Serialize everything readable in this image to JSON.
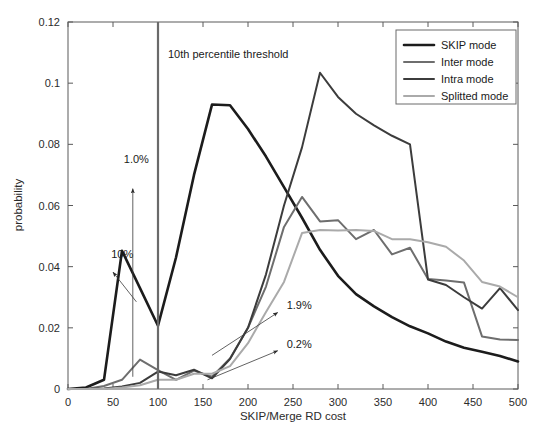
{
  "chart_data": {
    "type": "line",
    "title": "",
    "xlabel": "SKIP/Merge RD cost",
    "ylabel": "probability",
    "xlim": [
      0,
      500
    ],
    "ylim": [
      0,
      0.12
    ],
    "xticks": [
      0,
      50,
      100,
      150,
      200,
      250,
      300,
      350,
      400,
      450,
      500
    ],
    "xtick_labels": [
      "0",
      "50",
      "100",
      "150",
      "200",
      "250",
      "300",
      "350",
      "400",
      "450",
      "500"
    ],
    "yticks": [
      0,
      0.02,
      0.04,
      0.06,
      0.08,
      0.1,
      0.12
    ],
    "ytick_labels": [
      "0",
      "0.02",
      "0.04",
      "0.06",
      "0.08",
      "0.1",
      "0.12"
    ],
    "grid": false,
    "legend_position": "top-right",
    "x": [
      0,
      20,
      40,
      60,
      80,
      100,
      120,
      140,
      160,
      180,
      200,
      220,
      240,
      260,
      280,
      300,
      320,
      340,
      360,
      380,
      400,
      420,
      440,
      460,
      480,
      500
    ],
    "series": [
      {
        "name": "SKIP mode",
        "color": "#1c1c1c",
        "width": 2.6,
        "values": [
          0.0,
          0.0005,
          0.003,
          0.0452,
          0.033,
          0.0207,
          0.043,
          0.07,
          0.093,
          0.0928,
          0.085,
          0.076,
          0.066,
          0.056,
          0.0455,
          0.037,
          0.031,
          0.027,
          0.0235,
          0.0205,
          0.0182,
          0.0155,
          0.0135,
          0.0122,
          0.0108,
          0.009
        ]
      },
      {
        "name": "Inter mode",
        "color": "#6e6e6e",
        "width": 2.0,
        "values": [
          0.0,
          0.0,
          0.001,
          0.003,
          0.0096,
          0.0062,
          0.003,
          0.006,
          0.004,
          0.01,
          0.02,
          0.0335,
          0.053,
          0.0628,
          0.0548,
          0.0552,
          0.049,
          0.052,
          0.044,
          0.0462,
          0.036,
          0.0355,
          0.0348,
          0.0172,
          0.0162,
          0.016
        ]
      },
      {
        "name": "Intra mode",
        "color": "#3c3c3c",
        "width": 2.0,
        "values": [
          0.0,
          0.0,
          0.0002,
          0.0008,
          0.002,
          0.0057,
          0.0045,
          0.0063,
          0.0035,
          0.0098,
          0.02,
          0.0375,
          0.06,
          0.079,
          0.1034,
          0.0955,
          0.09,
          0.0862,
          0.0828,
          0.08,
          0.0358,
          0.034,
          0.03,
          0.0263,
          0.033,
          0.0258
        ]
      },
      {
        "name": "Splitted mode",
        "color": "#aaaaaa",
        "width": 2.0,
        "values": [
          0.0,
          0.0,
          0.0,
          0.0005,
          0.0012,
          0.003,
          0.003,
          0.005,
          0.005,
          0.0075,
          0.015,
          0.0252,
          0.035,
          0.051,
          0.052,
          0.0518,
          0.052,
          0.0517,
          0.049,
          0.049,
          0.048,
          0.0465,
          0.042,
          0.035,
          0.0335,
          0.03
        ]
      }
    ],
    "vline": {
      "name": "10th percentile threshold",
      "x": 100,
      "color": "#6a6a6a",
      "label": "10th percentile threshold"
    },
    "annotations": [
      {
        "label": "10%",
        "x": 40,
        "y": 0.0452,
        "text_x": 48,
        "text_y": 0.0428,
        "arrow_from_x": 76,
        "arrow_from_y": 0.0285,
        "arrow_to_x": 50,
        "arrow_to_y": 0.0382
      },
      {
        "label": "1.0%",
        "x": 72,
        "y": 0.07,
        "text_x": 62,
        "text_y": 0.0738,
        "arrow_from_x": 72,
        "arrow_from_y": 0.004,
        "arrow_to_x": 72,
        "arrow_to_y": 0.0655
      },
      {
        "label": "1.9%",
        "x": 230,
        "y": 0.025,
        "text_x": 243,
        "text_y": 0.0262,
        "arrow_from_x": 160,
        "arrow_from_y": 0.011,
        "arrow_to_x": 233,
        "arrow_to_y": 0.025
      },
      {
        "label": "0.2%",
        "x": 230,
        "y": 0.0125,
        "text_x": 243,
        "text_y": 0.0135,
        "arrow_from_x": 155,
        "arrow_from_y": 0.003,
        "arrow_to_x": 233,
        "arrow_to_y": 0.0125
      }
    ]
  },
  "legend": {
    "items": [
      {
        "label": "SKIP mode"
      },
      {
        "label": "Inter mode"
      },
      {
        "label": "Intra mode"
      },
      {
        "label": "Splitted mode"
      }
    ]
  },
  "axes": {
    "x_title": "SKIP/Merge RD cost",
    "y_title": "probability"
  }
}
